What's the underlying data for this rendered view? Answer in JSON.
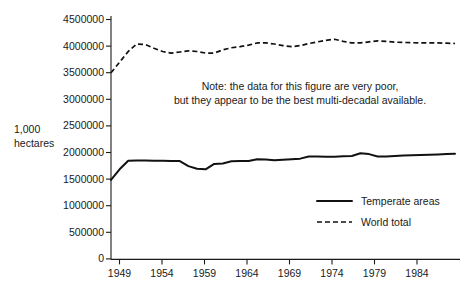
{
  "chart_data": {
    "type": "line",
    "title": "",
    "xlabel": "",
    "ylabel": "1,000 hectares",
    "xlim": [
      1948,
      1989
    ],
    "ylim": [
      0,
      4500000
    ],
    "grid": false,
    "legend_position": "bottom-right",
    "x_ticks": [
      "1949",
      "1954",
      "1959",
      "1964",
      "1969",
      "1974",
      "1979",
      "1984"
    ],
    "x_tick_values": [
      1949,
      1954,
      1959,
      1964,
      1969,
      1974,
      1979,
      1984
    ],
    "y_ticks": [
      "0",
      "500000",
      "1000000",
      "1500000",
      "2000000",
      "2500000",
      "3000000",
      "3500000",
      "4000000",
      "4500000"
    ],
    "y_tick_values": [
      0,
      500000,
      1000000,
      1500000,
      2000000,
      2500000,
      3000000,
      3500000,
      4000000,
      4500000
    ],
    "x": [
      1948,
      1949,
      1950,
      1951,
      1952,
      1953,
      1954,
      1955,
      1956,
      1957,
      1958,
      1959,
      1960,
      1961,
      1962,
      1963,
      1964,
      1965,
      1966,
      1967,
      1968,
      1969,
      1970,
      1971,
      1972,
      1973,
      1974,
      1975,
      1976,
      1977,
      1978,
      1979,
      1980,
      1981,
      1982,
      1983,
      1984,
      1985,
      1986,
      1987,
      1988
    ],
    "series": [
      {
        "name": "Temperate areas",
        "style": "solid",
        "values": [
          1490000,
          1690000,
          1850000,
          1855000,
          1855000,
          1852000,
          1850000,
          1848000,
          1845000,
          1750000,
          1700000,
          1690000,
          1790000,
          1800000,
          1840000,
          1845000,
          1845000,
          1880000,
          1875000,
          1860000,
          1870000,
          1880000,
          1890000,
          1930000,
          1930000,
          1925000,
          1925000,
          1935000,
          1940000,
          1990000,
          1975000,
          1930000,
          1930000,
          1940000,
          1950000,
          1955000,
          1960000,
          1965000,
          1970000,
          1975000,
          1980000
        ]
      },
      {
        "name": "World total",
        "style": "dashed",
        "values": [
          3500000,
          3700000,
          3900000,
          4040000,
          4030000,
          3960000,
          3900000,
          3870000,
          3890000,
          3910000,
          3900000,
          3870000,
          3870000,
          3930000,
          3970000,
          3990000,
          4020000,
          4060000,
          4060000,
          4040000,
          4010000,
          3990000,
          4010000,
          4050000,
          4080000,
          4110000,
          4130000,
          4090000,
          4060000,
          4060000,
          4080000,
          4100000,
          4090000,
          4075000,
          4070000,
          4065000,
          4060000,
          4060000,
          4060000,
          4055000,
          4050000
        ]
      }
    ],
    "annotations": [
      {
        "name": "data-quality-note",
        "line1": "Note: the data for this figure are very poor,",
        "line2": "but they appear to be the best multi-decadal available."
      }
    ],
    "legend": [
      {
        "label": "Temperate areas",
        "style": "solid"
      },
      {
        "label": "World total",
        "style": "dashed"
      }
    ],
    "axis_label_lines": [
      "1,000",
      "hectares"
    ],
    "colors": {
      "line": "#111111",
      "axis": "#1a1a1a",
      "background": "#ffffff"
    }
  }
}
